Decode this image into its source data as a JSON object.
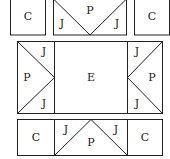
{
  "diagram": {
    "stroke_color": "#222222",
    "background": "#ffffff",
    "top_row": {
      "left_label": "C",
      "center_top_label": "P",
      "center_left_label": "J",
      "center_right_label": "J",
      "right_label": "C"
    },
    "middle_row": {
      "left_top_label": "J",
      "left_middle_label": "P",
      "left_bottom_label": "J",
      "center_label": "E",
      "right_top_label": "J",
      "right_middle_label": "P",
      "right_bottom_label": "J"
    },
    "bottom_row": {
      "left_label": "C",
      "center_left_label": "J",
      "center_bottom_label": "P",
      "center_right_label": "J",
      "right_label": "C"
    }
  }
}
